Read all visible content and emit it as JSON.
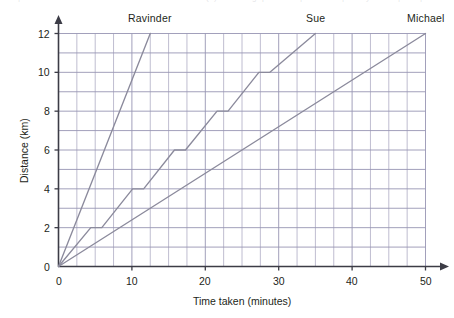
{
  "page": {
    "background_color": "#ffffff",
    "top_bleed_fragments": [
      "|",
      "9",
      "(",
      ")",
      "g",
      "p",
      "|",
      "|",
      "y",
      "|",
      "|"
    ]
  },
  "chart_data": {
    "type": "line",
    "title": "",
    "xlabel": "Time taken (minutes)",
    "ylabel": "Distance (km)",
    "xlim": [
      0,
      50
    ],
    "ylim": [
      0,
      12
    ],
    "xticks": [
      0,
      10,
      20,
      30,
      40,
      50
    ],
    "yticks": [
      0,
      2,
      4,
      6,
      8,
      10,
      12
    ],
    "xtick_labels": [
      "0",
      "10",
      "20",
      "30",
      "40",
      "50"
    ],
    "ytick_labels": [
      "0",
      "2",
      "4",
      "6",
      "8",
      "10",
      "12"
    ],
    "grid": true,
    "grid_x_step": 2.5,
    "grid_y_step": 1,
    "legend": "inline-end-labels",
    "series": [
      {
        "name": "Ravinder",
        "color": "#8b8a9c",
        "label_x": 12.5,
        "label_y": 12,
        "points": [
          [
            0,
            0
          ],
          [
            12.5,
            12
          ]
        ]
      },
      {
        "name": "Sue",
        "color": "#8b8a9c",
        "label_x": 35,
        "label_y": 12,
        "points": [
          [
            0,
            0
          ],
          [
            4.4,
            2
          ],
          [
            5.9,
            2
          ],
          [
            10.1,
            4
          ],
          [
            11.6,
            4
          ],
          [
            15.8,
            6
          ],
          [
            17.3,
            6
          ],
          [
            21.6,
            8
          ],
          [
            23.1,
            8
          ],
          [
            27.3,
            10
          ],
          [
            28.8,
            10
          ],
          [
            35,
            12
          ]
        ]
      },
      {
        "name": "Michael",
        "color": "#8b8a9c",
        "label_x": 50,
        "label_y": 12,
        "points": [
          [
            0,
            0
          ],
          [
            50,
            12
          ]
        ]
      }
    ],
    "colors": {
      "grid_major": "#9795b3",
      "grid_minor": "#a9a7c0",
      "axis": "#3c3c46",
      "series_line": "#8b8a9c",
      "text": "#231f20"
    }
  }
}
